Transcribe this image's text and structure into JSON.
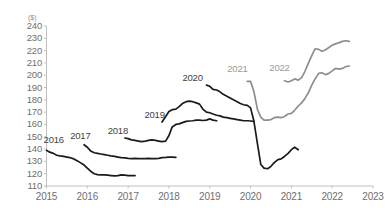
{
  "chart_data": {
    "type": "line",
    "title": "",
    "subtitle": "",
    "xlabel": "",
    "ylabel": "($)",
    "unit_label": "($)",
    "xlim": [
      2015,
      2023
    ],
    "ylim": [
      110,
      240
    ],
    "ytick_step": 10,
    "grid": false,
    "legend_position": "inline-labels",
    "axis_color": "#bfbfbf",
    "tick_label_color": "#6f6f6f",
    "xticks": [
      "2015",
      "2016",
      "2017",
      "2018",
      "2019",
      "2020",
      "2021",
      "2022",
      "2023"
    ],
    "yticks": [
      "240",
      "230",
      "220",
      "210",
      "200",
      "190",
      "180",
      "170",
      "160",
      "150",
      "140",
      "130",
      "120",
      "110"
    ],
    "series": [
      {
        "name": "2016",
        "color": "#1a1a1a",
        "label_color": "#3f3f3f",
        "label_x": 2015.15,
        "label_y": 147,
        "x": [
          2015.0,
          2015.08,
          2015.17,
          2015.25,
          2015.33,
          2015.42,
          2015.5,
          2015.58,
          2015.67,
          2015.75,
          2015.83,
          2015.92,
          2016.0,
          2016.08,
          2016.17,
          2016.25,
          2016.33,
          2016.42,
          2016.5,
          2016.58,
          2016.67,
          2016.75,
          2016.83,
          2016.92,
          2017.0,
          2017.08,
          2017.17
        ],
        "values": [
          139.0,
          137.5,
          136.5,
          135.0,
          134.5,
          134.0,
          133.5,
          133.0,
          132.0,
          130.5,
          129.0,
          127.0,
          124.5,
          122.0,
          120.0,
          119.2,
          119.0,
          119.0,
          118.8,
          118.5,
          118.2,
          118.5,
          119.0,
          118.8,
          118.5,
          118.5,
          118.5
        ]
      },
      {
        "name": "2017",
        "color": "#1a1a1a",
        "label_color": "#3f3f3f",
        "label_x": 2015.8,
        "label_y": 151,
        "x": [
          2015.92,
          2016.0,
          2016.08,
          2016.17,
          2016.25,
          2016.33,
          2016.42,
          2016.5,
          2016.58,
          2016.67,
          2016.75,
          2016.83,
          2016.92,
          2017.0,
          2017.08,
          2017.17,
          2017.25,
          2017.33,
          2017.42,
          2017.5,
          2017.58,
          2017.67,
          2017.75,
          2017.83,
          2017.92,
          2018.0,
          2018.08,
          2018.17
        ],
        "values": [
          143.5,
          141.5,
          138.5,
          137.0,
          136.5,
          136.0,
          135.5,
          135.0,
          134.5,
          134.0,
          133.5,
          133.0,
          132.8,
          132.5,
          132.3,
          132.5,
          132.3,
          132.2,
          132.3,
          132.5,
          132.3,
          132.2,
          132.5,
          133.0,
          133.2,
          133.5,
          133.5,
          133.2
        ]
      },
      {
        "name": "2018",
        "color": "#1a1a1a",
        "label_color": "#3f3f3f",
        "label_x": 2016.72,
        "label_y": 155,
        "x": [
          2016.92,
          2017.0,
          2017.08,
          2017.17,
          2017.25,
          2017.33,
          2017.42,
          2017.5,
          2017.58,
          2017.67,
          2017.75,
          2017.83,
          2017.92,
          2018.0,
          2018.08,
          2018.17,
          2018.25,
          2018.33,
          2018.42,
          2018.5,
          2018.58,
          2018.67,
          2018.75,
          2018.83,
          2018.92,
          2019.0,
          2019.08,
          2019.17
        ],
        "values": [
          149.0,
          148.5,
          147.5,
          147.0,
          146.5,
          146.0,
          146.5,
          147.0,
          147.5,
          147.0,
          146.5,
          146.0,
          146.5,
          151.0,
          158.0,
          160.0,
          160.5,
          161.5,
          162.5,
          162.8,
          163.0,
          163.5,
          163.5,
          163.2,
          163.5,
          164.5,
          163.5,
          163.0
        ]
      },
      {
        "name": "2019",
        "color": "#1a1a1a",
        "label_color": "#3f3f3f",
        "label_x": 2017.62,
        "label_y": 168,
        "x": [
          2017.83,
          2017.92,
          2018.0,
          2018.08,
          2018.17,
          2018.25,
          2018.33,
          2018.42,
          2018.5,
          2018.58,
          2018.67,
          2018.75,
          2018.83,
          2018.92,
          2019.0,
          2019.08,
          2019.17,
          2019.25,
          2019.33,
          2019.42,
          2019.5,
          2019.58,
          2019.67,
          2019.75,
          2019.83,
          2019.92,
          2020.0,
          2020.08
        ],
        "values": [
          162.0,
          166.5,
          170.5,
          172.0,
          172.5,
          174.5,
          177.0,
          178.5,
          179.0,
          178.5,
          177.5,
          176.5,
          172.5,
          170.0,
          169.5,
          168.5,
          167.5,
          167.0,
          166.0,
          165.5,
          165.0,
          164.5,
          164.0,
          163.5,
          163.0,
          163.0,
          162.8,
          162.5
        ]
      },
      {
        "name": "2020",
        "color": "#1a1a1a",
        "label_color": "#3f3f3f",
        "label_x": 2018.55,
        "label_y": 198,
        "x": [
          2018.92,
          2019.0,
          2019.08,
          2019.17,
          2019.25,
          2019.33,
          2019.42,
          2019.5,
          2019.58,
          2019.67,
          2019.75,
          2019.83,
          2019.92,
          2020.0,
          2020.08,
          2020.17,
          2020.25,
          2020.33,
          2020.42,
          2020.5,
          2020.58,
          2020.67,
          2020.75,
          2020.83,
          2020.92,
          2021.0,
          2021.08,
          2021.17
        ],
        "values": [
          192.0,
          191.0,
          188.5,
          188.0,
          186.5,
          184.5,
          183.0,
          181.5,
          180.0,
          178.5,
          177.0,
          176.0,
          175.5,
          173.5,
          163.0,
          144.0,
          127.5,
          124.5,
          124.0,
          126.0,
          129.0,
          131.5,
          132.0,
          134.0,
          136.5,
          139.5,
          141.5,
          139.5
        ]
      },
      {
        "name": "2021",
        "color": "#8e8e8e",
        "label_color": "#9a9a9a",
        "label_x": 2019.65,
        "label_y": 205,
        "x": [
          2019.92,
          2020.0,
          2020.08,
          2020.17,
          2020.25,
          2020.33,
          2020.42,
          2020.5,
          2020.58,
          2020.67,
          2020.75,
          2020.83,
          2020.92,
          2021.0,
          2021.08,
          2021.17,
          2021.25,
          2021.33,
          2021.42,
          2021.5,
          2021.58,
          2021.67,
          2021.75,
          2021.83,
          2021.92,
          2022.0,
          2022.08,
          2022.17,
          2022.25,
          2022.33,
          2022.42
        ],
        "values": [
          195.0,
          195.0,
          187.0,
          172.0,
          166.0,
          163.5,
          163.5,
          164.0,
          165.5,
          166.0,
          165.5,
          166.5,
          168.5,
          169.0,
          171.5,
          175.0,
          177.5,
          181.0,
          186.0,
          192.0,
          197.0,
          201.5,
          202.0,
          200.5,
          201.5,
          203.5,
          205.5,
          205.0,
          205.5,
          207.0,
          207.5
        ]
      },
      {
        "name": "2022",
        "color": "#8e8e8e",
        "label_color": "#9a9a9a",
        "label_x": 2020.68,
        "label_y": 206,
        "x": [
          2020.83,
          2020.92,
          2021.0,
          2021.08,
          2021.17,
          2021.25,
          2021.33,
          2021.42,
          2021.5,
          2021.58,
          2021.67,
          2021.75,
          2021.83,
          2021.92,
          2022.0,
          2022.08,
          2022.17,
          2022.25,
          2022.33,
          2022.42
        ],
        "values": [
          195.5,
          194.5,
          195.5,
          197.0,
          196.0,
          198.0,
          203.0,
          210.0,
          216.0,
          221.5,
          221.0,
          219.5,
          220.5,
          222.5,
          224.5,
          225.5,
          226.5,
          227.5,
          228.0,
          227.5
        ]
      }
    ]
  }
}
